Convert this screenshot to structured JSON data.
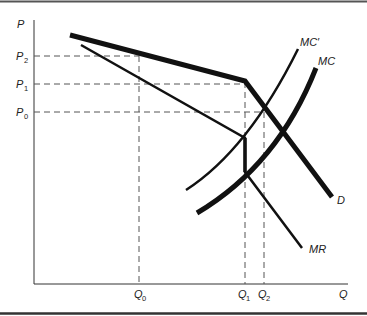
{
  "diagram": {
    "type": "kinked-demand-oligopoly",
    "axes": {
      "y_label": "P",
      "x_label": "Q"
    },
    "price_levels": [
      {
        "id": "P2",
        "base": "P",
        "sub": "2"
      },
      {
        "id": "P1",
        "base": "P",
        "sub": "1"
      },
      {
        "id": "P0",
        "base": "P",
        "sub": "0"
      }
    ],
    "quantity_levels": [
      {
        "id": "Q0",
        "base": "Q",
        "sub": "0"
      },
      {
        "id": "Q1",
        "base": "Q",
        "sub": "1"
      },
      {
        "id": "Q2",
        "base": "Q",
        "sub": "2"
      }
    ],
    "curves": {
      "demand": "D",
      "marginal_revenue": "MR",
      "marginal_cost": "MC",
      "marginal_cost_shifted": "MC′"
    },
    "colors": {
      "line": "#111111",
      "dashed": "#555555",
      "border": "#444444"
    }
  }
}
